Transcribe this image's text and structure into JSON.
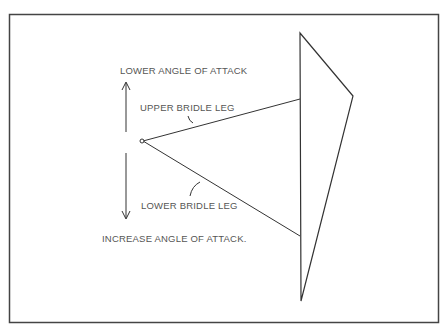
{
  "diagram": {
    "labels": {
      "lower_angle": "LOWER ANGLE OF ATTACK",
      "upper_leg": "UPPER BRIDLE LEG",
      "lower_leg": "LOWER BRIDLE LEG",
      "increase_angle": "INCREASE ANGLE OF ATTACK."
    },
    "colors": {
      "line": "#333333",
      "text": "#555555"
    }
  }
}
